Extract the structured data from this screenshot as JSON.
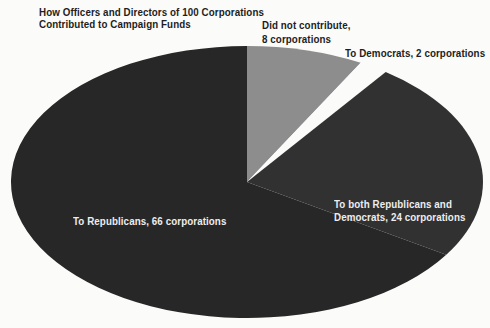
{
  "title": {
    "lines": [
      "How Officers and Directors of 100 Corporations",
      "Contributed to Campaign Funds"
    ]
  },
  "colors": {
    "background": "#fbfbf9",
    "slice_dark": "#272727",
    "slice_dark_alt": "#313131",
    "slice_gray": "#8d8d8d",
    "label_dark": "#1e1e1e",
    "label_light": "#ededed"
  },
  "chart_data": {
    "type": "pie",
    "title": "How Officers and Directors of 100 Corporations Contributed to Campaign Funds",
    "unit": "corporations",
    "total": 100,
    "start": "12-o-clock",
    "direction": "clockwise",
    "legend": "none",
    "ellipse": {
      "cx": 247,
      "cy": 182,
      "rx": 236,
      "ry": 136
    },
    "segments": [
      {
        "label": "Did not contribute",
        "value": 8,
        "color": "#8d8d8d",
        "callout_lines": [
          "Did not contribute,",
          "8 corporations"
        ]
      },
      {
        "label": "To Democrats",
        "value": 2,
        "color": "#fbfbf9",
        "callout_lines": [
          "To Democrats, 2 corporations"
        ]
      },
      {
        "label": "To both Republicans and Democrats",
        "value": 24,
        "color": "#313131",
        "callout_lines": [
          "To both Republicans and",
          "Democrats, 24 corporations"
        ]
      },
      {
        "label": "To Republicans",
        "value": 66,
        "color": "#272727",
        "callout_lines": [
          "To Republicans, 66 corporations"
        ]
      }
    ]
  }
}
